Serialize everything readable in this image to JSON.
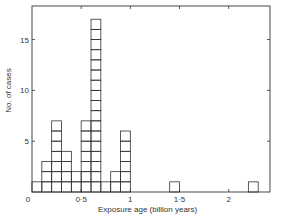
{
  "chart_data": {
    "type": "bar",
    "title": "",
    "xlabel": "Exposure age  (billion years)",
    "ylabel": "No. of cases",
    "bin_width": 0.1,
    "bins": [
      {
        "start": 0.0,
        "end": 0.1,
        "count": 1
      },
      {
        "start": 0.1,
        "end": 0.2,
        "count": 3
      },
      {
        "start": 0.2,
        "end": 0.3,
        "count": 7
      },
      {
        "start": 0.3,
        "end": 0.4,
        "count": 4
      },
      {
        "start": 0.4,
        "end": 0.5,
        "count": 2
      },
      {
        "start": 0.5,
        "end": 0.6,
        "count": 7
      },
      {
        "start": 0.6,
        "end": 0.7,
        "count": 17
      },
      {
        "start": 0.7,
        "end": 0.8,
        "count": 1
      },
      {
        "start": 0.8,
        "end": 0.9,
        "count": 2
      },
      {
        "start": 0.9,
        "end": 1.0,
        "count": 6
      },
      {
        "start": 1.4,
        "end": 1.5,
        "count": 1
      },
      {
        "start": 2.2,
        "end": 2.3,
        "count": 1
      }
    ],
    "categories": [
      "0.0-0.1",
      "0.1-0.2",
      "0.2-0.3",
      "0.3-0.4",
      "0.4-0.5",
      "0.5-0.6",
      "0.6-0.7",
      "0.7-0.8",
      "0.8-0.9",
      "0.9-1.0",
      "1.4-1.5",
      "2.2-2.3"
    ],
    "values": [
      1,
      3,
      7,
      4,
      2,
      7,
      17,
      1,
      2,
      6,
      1,
      1
    ],
    "x_ticks": [
      0,
      0.5,
      1,
      1.5,
      2
    ],
    "x_tick_labels": [
      "0",
      "0·5",
      "1",
      "1·5",
      "2"
    ],
    "y_ticks": [
      5,
      10,
      15
    ],
    "y_tick_labels": [
      "5",
      "10",
      "15"
    ],
    "xlim": [
      0,
      2.42
    ],
    "ylim": [
      0,
      18.3
    ],
    "grid": false,
    "legend": null,
    "style": "stacked unit squares (each square = one case)"
  },
  "labels": {
    "ylabel": "No. of cases",
    "xlabel": "Exposure age  (billion years)"
  },
  "colors": {
    "line": "#333333",
    "background": "#ffffff"
  }
}
